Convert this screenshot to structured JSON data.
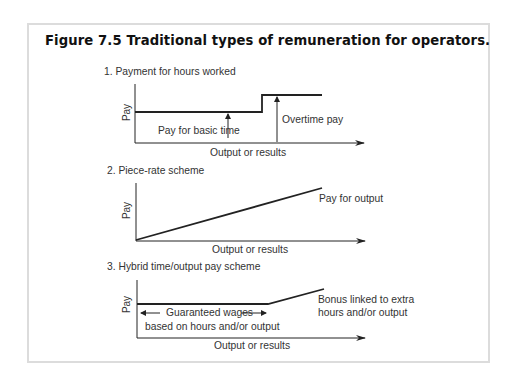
{
  "figure": {
    "title": "Figure 7.5  Traditional types of remuneration for operators."
  },
  "panels": [
    {
      "subtitle": "1. Payment for hours worked",
      "y_axis_label": "Pay",
      "x_axis_label": "Output or results",
      "annotations": [
        "Pay for basic time",
        "Overtime pay"
      ]
    },
    {
      "subtitle": "2. Piece-rate scheme",
      "y_axis_label": "Pay",
      "x_axis_label": "Output or results",
      "annotations": [
        "Pay for output"
      ]
    },
    {
      "subtitle": "3. Hybrid time/output pay scheme",
      "y_axis_label": "Pay",
      "x_axis_label": "Output or results",
      "annotations": [
        "Guaranteed wages",
        "based on hours and/or output",
        "Bonus linked to extra",
        "hours and/or output"
      ]
    }
  ],
  "colors": {
    "frame_border": "#dcdcdc",
    "line": "#222222",
    "text": "#333333"
  }
}
